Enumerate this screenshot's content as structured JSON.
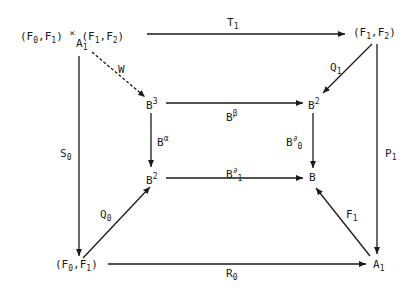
{
  "nodes": {
    "top_left": "(F0,F1) × (F1,F2)",
    "top_left_sub": "A1",
    "top_right": "(F1,F2)",
    "inner_top_left": "B^3",
    "inner_top_right": "B^2",
    "inner_bottom_left": "B^2",
    "inner_bottom_right": "B",
    "bottom_left": "(F0,F1)",
    "bottom_right": "A1"
  },
  "arrows": {
    "T1": "T1",
    "W": "W",
    "Q1": "Q1",
    "S0": "S0",
    "P1": "P1",
    "B_beta": "B^β",
    "B_alpha": "B^α",
    "B_d0": "B^∂0",
    "B_d1": "B^∂1",
    "Q0": "Q0",
    "F1": "F1",
    "R0": "R0"
  }
}
